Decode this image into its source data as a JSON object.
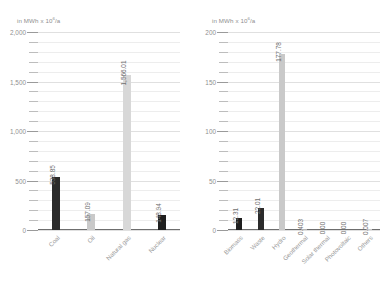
{
  "chart_data": [
    {
      "type": "bar",
      "title": "",
      "axis_unit": "in MWh x 10⁶/a",
      "unit_base": "in MWh x 10",
      "unit_exp": "6",
      "unit_suffix": "/a",
      "xlabel": "",
      "ylabel": "in MWh x 10⁶/a",
      "ylim": [
        0,
        2000
      ],
      "yticks": [
        0,
        500,
        1000,
        1500,
        2000
      ],
      "ytick_labels": [
        "0",
        "500",
        "1,000",
        "1,500",
        "2,000"
      ],
      "minor_tick_step": 100,
      "grid": true,
      "legend": "none",
      "categories": [
        "Coal",
        "Oil",
        "Natural gas",
        "Nuclear"
      ],
      "values": [
        538.85,
        157.09,
        1566.01,
        148.94
      ],
      "value_labels": [
        "538.85",
        "157.09",
        "1,566.01",
        "148.94"
      ],
      "bar_colors": [
        "#2b2b2b",
        "#c9c9c9",
        "#d8d8d8",
        "#1f1f1f"
      ]
    },
    {
      "type": "bar",
      "title": "",
      "axis_unit": "in MWh x 10⁶/a",
      "unit_base": "in MWh x 10",
      "unit_exp": "6",
      "unit_suffix": "/a",
      "xlabel": "",
      "ylabel": "in MWh x 10⁶/a",
      "ylim": [
        0,
        200
      ],
      "yticks": [
        0,
        50,
        100,
        150,
        200
      ],
      "ytick_labels": [
        "0",
        "50",
        "100",
        "150",
        "200"
      ],
      "minor_tick_step": 10,
      "grid": true,
      "legend": "none",
      "categories": [
        "Biomass",
        "Waste",
        "Hydro",
        "Geothermal",
        "Solar thermal",
        "Photovoltaic",
        "Others"
      ],
      "values": [
        12.31,
        22.01,
        177.78,
        0.403,
        0.0,
        0.0,
        0.007
      ],
      "value_labels": [
        "12.31",
        "22.01",
        "177.78",
        "0.403",
        "0.00",
        "0.00",
        "0.007"
      ],
      "bar_colors": [
        "#1f1f1f",
        "#2b2b2b",
        "#c9c9c9",
        "#b4b4b4",
        "#c9c9c9",
        "#c9c9c9",
        "#c9c9c9"
      ]
    }
  ]
}
